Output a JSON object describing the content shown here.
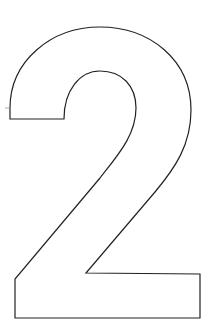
{
  "figure": {
    "glyph": "2",
    "stroke_color": "#222222",
    "fill_color": "#ffffff",
    "background": "#ffffff"
  }
}
